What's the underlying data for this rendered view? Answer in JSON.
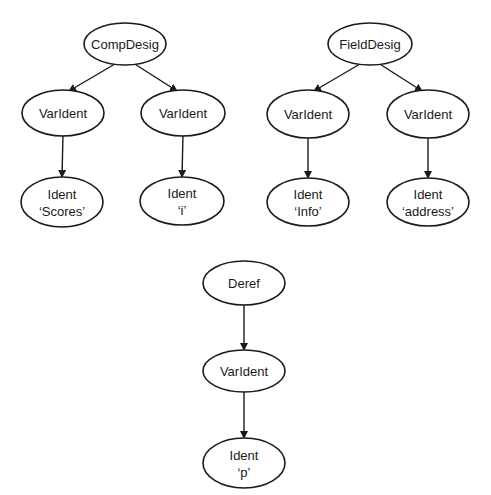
{
  "diagram": {
    "type": "syntax-tree-diagrams",
    "colors": {
      "stroke": "#1a1a1a",
      "background": "#ffffff"
    },
    "trees": [
      {
        "name": "comp-desig-tree",
        "nodes": [
          {
            "id": "n1",
            "label": "CompDesig",
            "sublabel": "",
            "cx": 125,
            "cy": 44,
            "rx": 41,
            "ry": 21
          },
          {
            "id": "n2",
            "label": "VarIdent",
            "sublabel": "",
            "cx": 63,
            "cy": 113,
            "rx": 41,
            "ry": 23
          },
          {
            "id": "n3",
            "label": "VarIdent",
            "sublabel": "",
            "cx": 183,
            "cy": 113,
            "rx": 42,
            "ry": 23
          },
          {
            "id": "n4",
            "label": "Ident",
            "sublabel": "'Scores'",
            "cx": 62,
            "cy": 202,
            "rx": 41,
            "ry": 25
          },
          {
            "id": "n5",
            "label": "Ident",
            "sublabel": "'i'",
            "cx": 182,
            "cy": 201,
            "rx": 42,
            "ry": 24
          }
        ],
        "edges": [
          {
            "from": "n1",
            "to": "n2"
          },
          {
            "from": "n1",
            "to": "n3"
          },
          {
            "from": "n2",
            "to": "n4"
          },
          {
            "from": "n3",
            "to": "n5"
          }
        ]
      },
      {
        "name": "field-desig-tree",
        "nodes": [
          {
            "id": "m1",
            "label": "FieldDesig",
            "sublabel": "",
            "cx": 370,
            "cy": 44,
            "rx": 42,
            "ry": 21
          },
          {
            "id": "m2",
            "label": "VarIdent",
            "sublabel": "",
            "cx": 308,
            "cy": 114,
            "rx": 41,
            "ry": 24
          },
          {
            "id": "m3",
            "label": "VarIdent",
            "sublabel": "",
            "cx": 428,
            "cy": 114,
            "rx": 41,
            "ry": 24
          },
          {
            "id": "m4",
            "label": "Ident",
            "sublabel": "'Info'",
            "cx": 308,
            "cy": 202,
            "rx": 41,
            "ry": 24
          },
          {
            "id": "m5",
            "label": "Ident",
            "sublabel": "'address'",
            "cx": 428,
            "cy": 202,
            "rx": 41,
            "ry": 24
          }
        ],
        "edges": [
          {
            "from": "m1",
            "to": "m2"
          },
          {
            "from": "m1",
            "to": "m3"
          },
          {
            "from": "m2",
            "to": "m4"
          },
          {
            "from": "m3",
            "to": "m5"
          }
        ]
      },
      {
        "name": "deref-tree",
        "nodes": [
          {
            "id": "d1",
            "label": "Deref",
            "sublabel": "",
            "cx": 244,
            "cy": 283,
            "rx": 41,
            "ry": 22
          },
          {
            "id": "d2",
            "label": "VarIdent",
            "sublabel": "",
            "cx": 244,
            "cy": 371,
            "rx": 41,
            "ry": 21
          },
          {
            "id": "d3",
            "label": "Ident",
            "sublabel": "'p'",
            "cx": 244,
            "cy": 463,
            "rx": 41,
            "ry": 25
          }
        ],
        "edges": [
          {
            "from": "d1",
            "to": "d2"
          },
          {
            "from": "d2",
            "to": "d3"
          }
        ]
      }
    ]
  }
}
